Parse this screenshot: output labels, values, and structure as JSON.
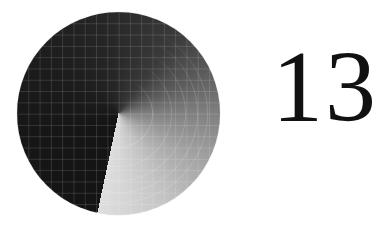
{
  "display": {
    "value": "13"
  },
  "dial": {
    "type": "conic-sweep",
    "gradient_start_color": "#141414",
    "gradient_end_color": "#dedede",
    "grid_line_color": "#ffffff",
    "icon": "radar-sweep-icon"
  },
  "colors": {
    "background": "#ffffff",
    "text": "#111111"
  }
}
